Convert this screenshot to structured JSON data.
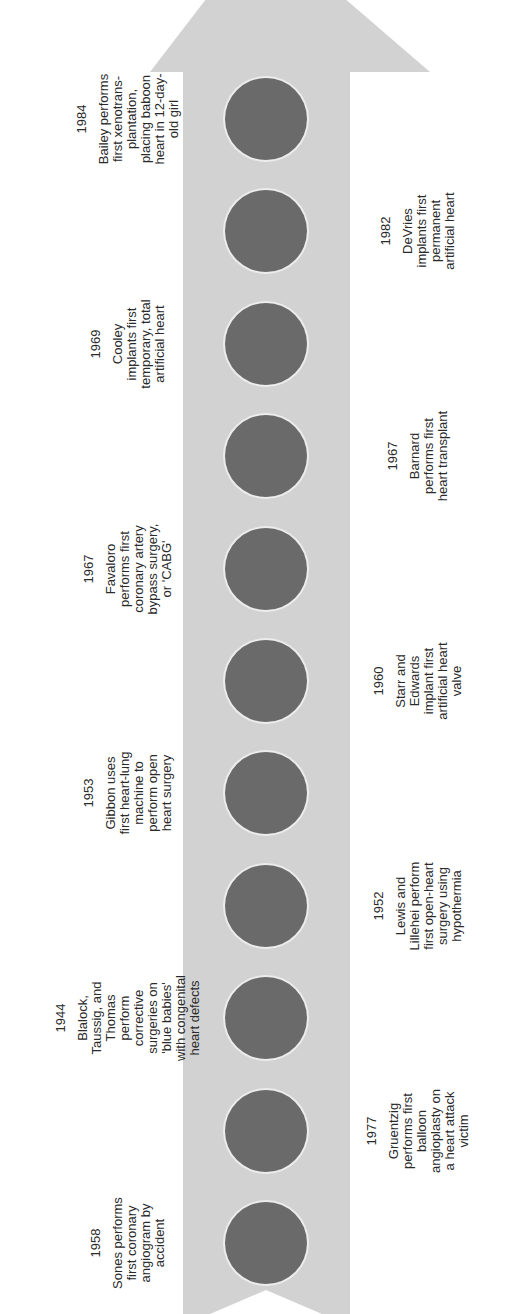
{
  "diagram": {
    "type": "timeline",
    "orientation": "vertical-up",
    "colors": {
      "arrow": "#d2d2d2",
      "marker": "#6a6a6a",
      "text": "#2a2a2a"
    }
  },
  "events": [
    {
      "year": "1958",
      "text": "Sones performs first coronary angiogram by accident",
      "side": "left"
    },
    {
      "year": "1977",
      "text": "Gruentzig performs first balloon angioplasty on a heart attack victim",
      "side": "right"
    },
    {
      "year": "1944",
      "text": "Blalock, Taussig, and Thomas perform corrective surgeries on 'blue babies' with congenital heart defects",
      "side": "left"
    },
    {
      "year": "1952",
      "text": "Lewis and Lillehei perform first open-heart surgery using hypothermia",
      "side": "right"
    },
    {
      "year": "1953",
      "text": "Gibbon uses first heart-lung machine to perform open heart surgery",
      "side": "left"
    },
    {
      "year": "1960",
      "text": "Starr and Edwards implant first artificial heart valve",
      "side": "right"
    },
    {
      "year": "1967",
      "text": "Favaloro performs first coronary artery bypass surgery, or 'CABG'",
      "side": "left"
    },
    {
      "year": "1967",
      "text": "Barnard performs first heart transplant",
      "side": "right"
    },
    {
      "year": "1969",
      "text": "Cooley implants first temporary, total artificial heart",
      "side": "left"
    },
    {
      "year": "1982",
      "text": "DeVries implants first permanent artificial heart",
      "side": "right"
    },
    {
      "year": "1984",
      "text": "Bailey performs first xenotrans-plantation, placing baboon heart in 12-day-old girl",
      "side": "left"
    }
  ]
}
